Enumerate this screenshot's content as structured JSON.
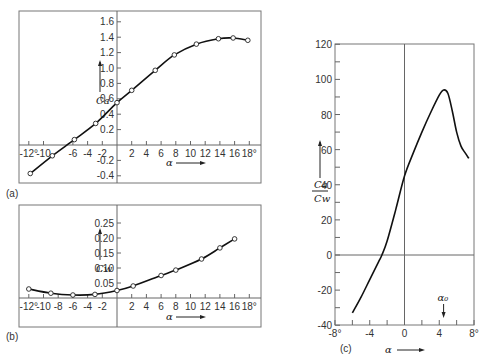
{
  "chart_data": [
    {
      "id": "a",
      "panel_label": "(a)",
      "type": "line",
      "ylabel": "C_a",
      "xlabel": "α",
      "xlim": [
        -12,
        18
      ],
      "ylim": [
        -0.45,
        1.7
      ],
      "x_ticks": [
        "-12°",
        "-10",
        "-6",
        "-4",
        "-2",
        "2",
        "4",
        "6",
        "8",
        "10",
        "12",
        "14",
        "16",
        "18°"
      ],
      "y_ticks": [
        "1.6",
        "1.4",
        "1.2",
        "1.0",
        "0.8",
        "0.6",
        "0.4",
        "0.2",
        "-0.2",
        "-0.4"
      ],
      "grid": false,
      "markers": "open-circle",
      "x": [
        -11.8,
        -8.8,
        -5.8,
        -2.9,
        0,
        2,
        5.2,
        7.8,
        10.8,
        13.8,
        15.8,
        17.8
      ],
      "values": [
        -0.37,
        -0.14,
        0.07,
        0.28,
        0.55,
        0.71,
        0.97,
        1.17,
        1.31,
        1.38,
        1.39,
        1.36
      ]
    },
    {
      "id": "b",
      "panel_label": "(b)",
      "type": "line",
      "ylabel": "C_w",
      "xlabel": "α",
      "xlim": [
        -12,
        18
      ],
      "ylim": [
        -0.1,
        0.3
      ],
      "x_ticks": [
        "-12°",
        "-10",
        "-8",
        "-6",
        "-4",
        "-2",
        "2",
        "4",
        "6",
        "8",
        "10",
        "12",
        "14",
        "16",
        "18°"
      ],
      "y_ticks": [
        "0.25",
        "0.20",
        "0.15",
        "0.10",
        "0.05"
      ],
      "grid": false,
      "markers": "open-circle",
      "x": [
        -12,
        -9,
        -6,
        -3,
        0,
        2.2,
        6,
        8,
        11.5,
        14,
        16
      ],
      "values": [
        0.03,
        0.016,
        0.01,
        0.012,
        0.025,
        0.04,
        0.075,
        0.093,
        0.13,
        0.167,
        0.197
      ]
    },
    {
      "id": "c",
      "panel_label": "(c)",
      "type": "line",
      "ylabel": "C_a / C_w",
      "xlabel": "α",
      "annotation": "α_0",
      "annotation_x": 4.5,
      "xlim": [
        -8,
        8
      ],
      "ylim": [
        -40,
        120
      ],
      "x_ticks": [
        "-8°",
        "-4",
        "0",
        "4",
        "8°"
      ],
      "y_ticks": [
        "120",
        "100",
        "80",
        "60",
        "40",
        "20",
        "0",
        "-20",
        "-40"
      ],
      "grid": false,
      "markers": "none",
      "x": [
        -6,
        -5,
        -4,
        -3,
        -2.6,
        -2,
        -1,
        0,
        1,
        2,
        3,
        4,
        4.5,
        5,
        5.5,
        6,
        6.5,
        7,
        7.4
      ],
      "values": [
        -33,
        -24,
        -14,
        -4,
        0,
        8,
        26,
        45,
        58,
        70,
        81,
        91,
        94,
        92,
        82,
        70,
        62,
        58,
        55
      ]
    }
  ]
}
